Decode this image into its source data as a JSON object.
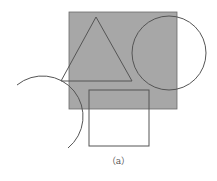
{
  "diagram": {
    "caption": "（a）",
    "colors": {
      "fill": "#a7a7a7",
      "stroke": "#555555",
      "background": "#ffffff"
    },
    "shapes": [
      {
        "type": "rect",
        "name": "gray-square",
        "x": 69,
        "y": 12,
        "width": 108,
        "height": 97,
        "filled": true
      },
      {
        "type": "triangle",
        "name": "triangle",
        "points": [
          [
            96,
            17
          ],
          [
            61,
            81
          ],
          [
            132,
            81
          ]
        ]
      },
      {
        "type": "circle",
        "name": "right-circle",
        "cx": 169,
        "cy": 53,
        "r": 37
      },
      {
        "type": "rect",
        "name": "lower-rectangle",
        "x": 89,
        "y": 90,
        "width": 60,
        "height": 56
      },
      {
        "type": "arc",
        "name": "left-arc",
        "cx": 36,
        "cy": 120,
        "r": 40,
        "from": [
          17,
          85
        ],
        "to": [
          68,
          148
        ]
      }
    ]
  }
}
